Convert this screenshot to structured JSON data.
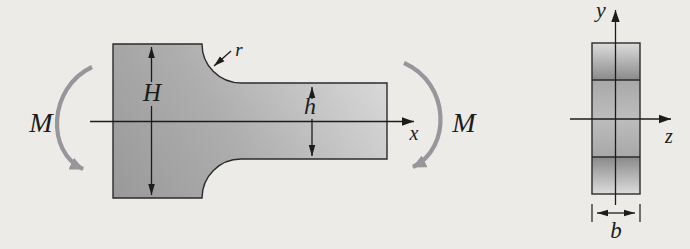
{
  "figure": {
    "labels": {
      "moment_left": "M",
      "moment_right": "M",
      "large_height": "H",
      "small_height": "h",
      "fillet_radius": "r",
      "axis_x": "x",
      "axis_y": "y",
      "axis_z": "z",
      "section_width": "b"
    },
    "colors": {
      "background": "#ecebe8",
      "outline": "#2b2b2b",
      "text": "#1c1c1c",
      "moment_arrow": "#97979b",
      "bar_gradient_dark": "#989898",
      "bar_gradient_light": "#e2e2e2",
      "band_dark": "#8a8a8a",
      "band_light": "#dcdcdc",
      "band_mid": "#bdbdbd"
    }
  }
}
